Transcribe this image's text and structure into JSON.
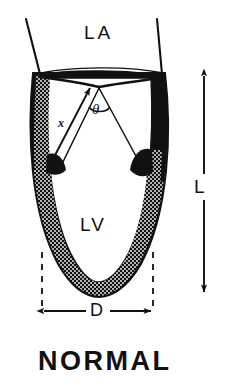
{
  "figure": {
    "title": "NORMAL",
    "type": "anatomical-diagram",
    "background_color": "#ffffff",
    "ink_color": "#111111",
    "labels": {
      "left_atrium": "LA",
      "left_ventricle": "LV",
      "angle": "θ",
      "wall_segment": "x",
      "diameter": "D",
      "length": "L"
    },
    "annotations": [
      {
        "name": "left-atrium-label",
        "text": "LA",
        "meaning": "left atrium chamber"
      },
      {
        "name": "left-ventricle-label",
        "text": "LV",
        "meaning": "left ventricle cavity"
      },
      {
        "name": "theta-angle-label",
        "text": "θ",
        "meaning": "angle subtended at the mitral valve between the two chamber axes"
      },
      {
        "name": "x-measure-label",
        "text": "x",
        "meaning": "double headed arrow measuring distance along the ventricular wall axis"
      },
      {
        "name": "diameter-measure-label",
        "text": "D",
        "meaning": "short axis minor diameter of the left ventricle"
      },
      {
        "name": "length-measure-label",
        "text": "L",
        "meaning": "long axis length of the left ventricle"
      }
    ],
    "measurements": [
      {
        "name": "D",
        "orientation": "horizontal",
        "arrowheads": "both",
        "guides": "dashed vertical leader lines"
      },
      {
        "name": "L",
        "orientation": "vertical",
        "arrowheads": "both",
        "guides": "none"
      },
      {
        "name": "x",
        "orientation": "diagonal",
        "arrowheads": "both",
        "guides": "none"
      }
    ],
    "caption": "NORMAL"
  }
}
